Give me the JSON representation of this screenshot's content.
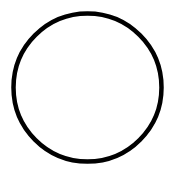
{
  "chart_data": {
    "type": "pie",
    "title": "",
    "labels": [
      "",
      "",
      "",
      ""
    ],
    "values": [
      50,
      14.4,
      21.2,
      14.4
    ],
    "slice_angles_deg": [
      180,
      52,
      76,
      52
    ],
    "legend": [],
    "show_labels": false,
    "colors": {
      "fill": "#ffffff",
      "outline": "#000000",
      "divider": "#333333"
    }
  }
}
